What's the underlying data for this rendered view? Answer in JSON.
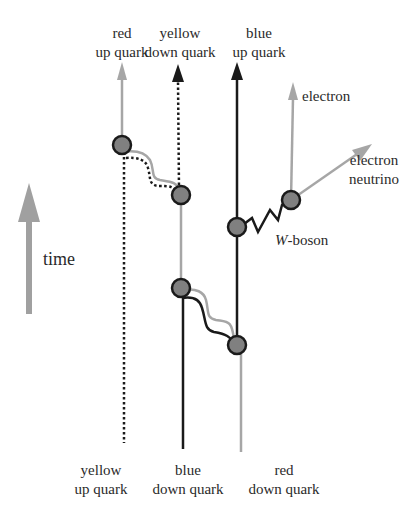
{
  "diagram": {
    "type": "feynman-diagram",
    "top_labels": [
      {
        "line1": "red",
        "line2": "up quark"
      },
      {
        "line1": "yellow",
        "line2": "down quark"
      },
      {
        "line1": "blue",
        "line2": "up quark"
      }
    ],
    "bottom_labels": [
      {
        "line1": "yellow",
        "line2": "up quark"
      },
      {
        "line1": "blue",
        "line2": "down quark"
      },
      {
        "line1": "red",
        "line2": "down quark"
      }
    ],
    "lepton_labels": {
      "electron": "electron",
      "neutrino_line1": "electron",
      "neutrino_line2": "neutrino"
    },
    "boson_label": {
      "italic": "W",
      "rest": "-boson"
    },
    "time_label": "time",
    "colors": {
      "gray_line": "#a6a6a6",
      "black_line": "#1a1a1a",
      "vertex_fill": "#808080",
      "vertex_stroke": "#1a1a1a",
      "time_arrow": "#a0a0a0",
      "text": "#2a2a2a"
    }
  }
}
